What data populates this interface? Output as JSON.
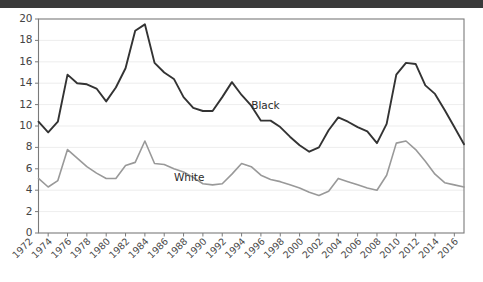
{
  "chart_data": {
    "type": "line",
    "title": "",
    "subtitle": "",
    "xlabel": "",
    "ylabel": "",
    "xlim": [
      1973,
      2017
    ],
    "ylim": [
      0,
      20
    ],
    "ytick_step": 2,
    "xtick_step": 2,
    "grid": "horizontal",
    "legend_position": "inline-annotation",
    "yticks": [
      0,
      2,
      4,
      6,
      8,
      10,
      12,
      14,
      16,
      18,
      20
    ],
    "xticks": [
      1972,
      1974,
      1976,
      1978,
      1980,
      1982,
      1984,
      1986,
      1988,
      1990,
      1992,
      1994,
      1996,
      1998,
      2000,
      2002,
      2004,
      2006,
      2008,
      2010,
      2012,
      2014,
      2016
    ],
    "x": [
      1973,
      1974,
      1975,
      1976,
      1977,
      1978,
      1979,
      1980,
      1981,
      1982,
      1983,
      1984,
      1985,
      1986,
      1987,
      1988,
      1989,
      1990,
      1991,
      1992,
      1993,
      1994,
      1995,
      1996,
      1997,
      1998,
      1999,
      2000,
      2001,
      2002,
      2003,
      2004,
      2005,
      2006,
      2007,
      2008,
      2009,
      2010,
      2011,
      2012,
      2013,
      2014,
      2015,
      2016,
      2017
    ],
    "series": [
      {
        "name": "Black",
        "color": "#333333",
        "label_x": 1995,
        "label_y": 11.6,
        "values": [
          10.4,
          9.4,
          10.4,
          14.8,
          14.0,
          13.9,
          13.5,
          12.3,
          13.6,
          15.4,
          18.9,
          19.5,
          15.9,
          15.0,
          14.4,
          12.7,
          11.7,
          11.4,
          11.4,
          12.7,
          14.1,
          12.9,
          11.9,
          10.5,
          10.5,
          9.9,
          9.0,
          8.2,
          7.6,
          8.0,
          9.6,
          10.8,
          10.4,
          9.9,
          9.5,
          8.4,
          10.2,
          14.8,
          15.9,
          15.8,
          13.8,
          13.0,
          11.5,
          9.9,
          8.3
        ]
      },
      {
        "name": "White",
        "color": "#999999",
        "label_x": 1987,
        "label_y": 4.85,
        "values": [
          5.1,
          4.3,
          4.9,
          7.8,
          7.0,
          6.2,
          5.6,
          5.1,
          5.1,
          6.3,
          6.6,
          8.6,
          6.5,
          6.4,
          6.0,
          5.7,
          5.2,
          4.6,
          4.5,
          4.6,
          5.5,
          6.5,
          6.2,
          5.4,
          5.0,
          4.8,
          4.5,
          4.2,
          3.8,
          3.5,
          3.9,
          5.1,
          4.8,
          4.5,
          4.2,
          4.0,
          5.4,
          8.4,
          8.6,
          7.8,
          6.7,
          5.5,
          4.7,
          4.5,
          4.3
        ]
      }
    ]
  }
}
